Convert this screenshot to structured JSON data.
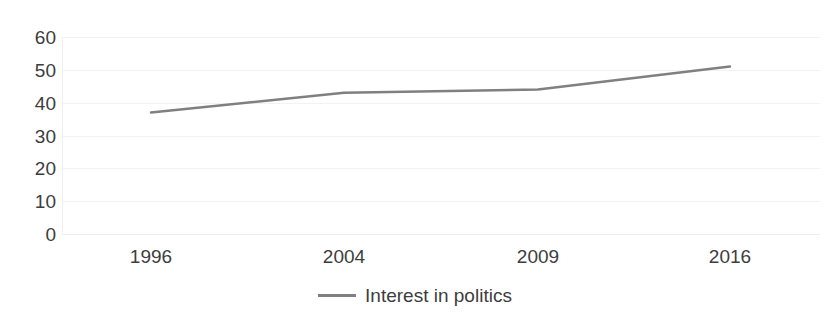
{
  "chart_data": {
    "type": "line",
    "title": "",
    "subtitle": "",
    "xlabel": "",
    "ylabel": "",
    "categories": [
      "1996",
      "2004",
      "2009",
      "2016"
    ],
    "series": [
      {
        "name": "Interest in politics",
        "color": "#808080",
        "values": [
          37,
          43,
          44,
          51
        ]
      }
    ],
    "ylim": [
      0,
      60
    ],
    "y_ticks": [
      "60",
      "50",
      "40",
      "30",
      "20",
      "10",
      "0"
    ],
    "y_tick_values": [
      60,
      50,
      40,
      30,
      20,
      10,
      0
    ],
    "x_ticks": [
      "1996",
      "2004",
      "2009",
      "2016"
    ],
    "grid": {
      "horizontal": true,
      "vertical": false,
      "color": "#f2f2f2"
    },
    "legend": {
      "position": "bottom",
      "entries": [
        {
          "label": "Interest in politics",
          "color": "#808080"
        }
      ]
    },
    "markers": false,
    "background": "#ffffff",
    "text_color": "#3d3d3d"
  }
}
